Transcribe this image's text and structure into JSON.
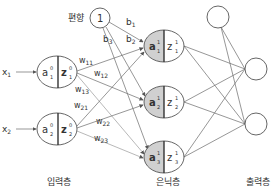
{
  "bias": {
    "label": "편향",
    "value": "1"
  },
  "inputs": [
    {
      "x_label": "x",
      "x_sub": "1",
      "a": "a",
      "a_sup": "0",
      "a_sub": "1",
      "z": "z",
      "z_sup": "0",
      "z_sub": "1"
    },
    {
      "x_label": "x",
      "x_sub": "2",
      "a": "a",
      "a_sup": "0",
      "a_sub": "2",
      "z": "z",
      "z_sup": "0",
      "z_sub": "2"
    }
  ],
  "hidden": [
    {
      "a": "a",
      "a_sup": "1",
      "a_sub": "1",
      "z": "z",
      "z_sup": "1",
      "z_sub": "1"
    },
    {
      "a": "a",
      "a_sup": "1",
      "a_sub": "2",
      "z": "z",
      "z_sup": "1",
      "z_sub": "2"
    },
    {
      "a": "a",
      "a_sup": "1",
      "a_sub": "3",
      "z": "z",
      "z_sup": "1",
      "z_sub": "3"
    }
  ],
  "weights": [
    {
      "w": "w",
      "sub": "11"
    },
    {
      "w": "w",
      "sub": "12"
    },
    {
      "w": "w",
      "sub": "13"
    },
    {
      "w": "w",
      "sub": "21"
    },
    {
      "w": "w",
      "sub": "22"
    },
    {
      "w": "w",
      "sub": "23"
    }
  ],
  "biases": [
    {
      "b": "b",
      "sub": "1"
    },
    {
      "b": "b",
      "sub": "2"
    },
    {
      "b": "b",
      "sub": "3"
    }
  ],
  "layer_labels": {
    "input": "입력층",
    "hidden": "은닉층",
    "output": "출력층"
  },
  "colors": {
    "shade": "#d0d0d0",
    "line": "#6a6a6a",
    "text": "#333333"
  }
}
